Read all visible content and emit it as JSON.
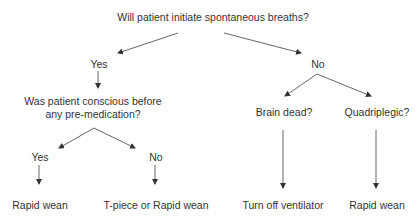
{
  "diagram": {
    "type": "decision-tree",
    "colors": {
      "text": "#333333",
      "line": "#555555"
    },
    "nodes": {
      "root": "Will patient initiate spontaneous breaths?",
      "yes": "Yes",
      "no": "No",
      "conscious_q_line1": "Was patient conscious before",
      "conscious_q_line2": "any pre-medication?",
      "conscious_yes": "Yes",
      "conscious_no": "No",
      "brain_dead": "Brain dead?",
      "quadriplegic": "Quadriplegic?",
      "outcome_conscious_yes": "Rapid wean",
      "outcome_conscious_no": "T-piece or Rapid wean",
      "outcome_brain_dead": "Turn off ventilator",
      "outcome_quadriplegic": "Rapid wean"
    },
    "edges": [
      {
        "from": "root",
        "to": "yes"
      },
      {
        "from": "root",
        "to": "no"
      },
      {
        "from": "yes",
        "to": "conscious_q"
      },
      {
        "from": "conscious_q",
        "to": "conscious_yes"
      },
      {
        "from": "conscious_q",
        "to": "conscious_no"
      },
      {
        "from": "conscious_yes",
        "to": "outcome_conscious_yes"
      },
      {
        "from": "conscious_no",
        "to": "outcome_conscious_no"
      },
      {
        "from": "no",
        "to": "brain_dead"
      },
      {
        "from": "no",
        "to": "quadriplegic"
      },
      {
        "from": "brain_dead",
        "to": "outcome_brain_dead"
      },
      {
        "from": "quadriplegic",
        "to": "outcome_quadriplegic"
      }
    ]
  }
}
